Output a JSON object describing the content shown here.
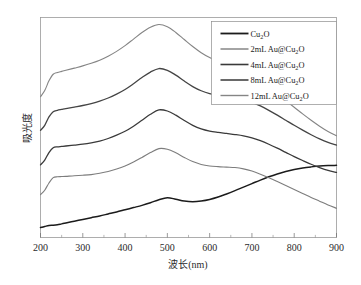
{
  "chart_data": {
    "type": "line",
    "title": "",
    "xlabel": "波长(nm)",
    "ylabel": "吸光度",
    "xlim": [
      200,
      900
    ],
    "ylim": [
      0,
      1
    ],
    "xticks": [
      200,
      300,
      400,
      500,
      600,
      700,
      800,
      900
    ],
    "xticklabels": [
      "200",
      "300",
      "400",
      "500",
      "600",
      "700",
      "800",
      "900"
    ],
    "yticks": [],
    "yticklabels": [],
    "grid": false,
    "legend_position": "upper right",
    "note": "UV-Vis absorption spectra; curves vertically offset; y-axis unlabeled (arbitrary absorbance units)",
    "x": [
      200,
      210,
      220,
      230,
      240,
      250,
      260,
      280,
      300,
      320,
      340,
      360,
      380,
      400,
      420,
      440,
      460,
      480,
      500,
      520,
      540,
      560,
      580,
      600,
      620,
      640,
      660,
      680,
      700,
      720,
      740,
      760,
      780,
      800,
      820,
      840,
      860,
      880,
      900
    ],
    "series": [
      {
        "name": "Cu2O",
        "color": "#1b1b1b",
        "width": 1.5,
        "values": [
          0.045,
          0.05,
          0.055,
          0.056,
          0.058,
          0.062,
          0.066,
          0.074,
          0.082,
          0.09,
          0.098,
          0.107,
          0.116,
          0.126,
          0.136,
          0.146,
          0.158,
          0.172,
          0.181,
          0.174,
          0.166,
          0.163,
          0.166,
          0.173,
          0.184,
          0.198,
          0.213,
          0.229,
          0.245,
          0.261,
          0.276,
          0.289,
          0.3,
          0.309,
          0.316,
          0.321,
          0.325,
          0.327,
          0.328
        ]
      },
      {
        "name": "2mL Au@Cu2O",
        "color": "#7d7d7d",
        "width": 1.1,
        "values": [
          0.195,
          0.215,
          0.248,
          0.272,
          0.276,
          0.277,
          0.278,
          0.281,
          0.283,
          0.286,
          0.292,
          0.3,
          0.311,
          0.325,
          0.343,
          0.364,
          0.386,
          0.404,
          0.401,
          0.385,
          0.364,
          0.345,
          0.332,
          0.325,
          0.322,
          0.32,
          0.318,
          0.312,
          0.302,
          0.288,
          0.272,
          0.254,
          0.236,
          0.218,
          0.2,
          0.182,
          0.165,
          0.148,
          0.133
        ]
      },
      {
        "name": "4mL Au@Cu2O",
        "color": "#3a3a3a",
        "width": 1.3,
        "values": [
          0.33,
          0.352,
          0.386,
          0.408,
          0.412,
          0.414,
          0.416,
          0.42,
          0.424,
          0.43,
          0.438,
          0.45,
          0.465,
          0.483,
          0.506,
          0.533,
          0.56,
          0.58,
          0.575,
          0.556,
          0.532,
          0.51,
          0.494,
          0.484,
          0.478,
          0.473,
          0.468,
          0.462,
          0.453,
          0.44,
          0.424,
          0.406,
          0.387,
          0.368,
          0.35,
          0.333,
          0.318,
          0.305,
          0.296
        ]
      },
      {
        "name": "8mL Au@Cu2O",
        "color": "#444444",
        "width": 1.3,
        "values": [
          0.487,
          0.51,
          0.548,
          0.572,
          0.578,
          0.582,
          0.586,
          0.593,
          0.6,
          0.609,
          0.62,
          0.634,
          0.652,
          0.673,
          0.699,
          0.727,
          0.752,
          0.768,
          0.76,
          0.738,
          0.711,
          0.686,
          0.667,
          0.654,
          0.646,
          0.64,
          0.634,
          0.626,
          0.614,
          0.598,
          0.578,
          0.556,
          0.533,
          0.51,
          0.488,
          0.467,
          0.448,
          0.432,
          0.42
        ]
      },
      {
        "name": "12mL Au@Cu2O",
        "color": "#858585",
        "width": 1.1,
        "values": [
          0.64,
          0.668,
          0.712,
          0.742,
          0.75,
          0.755,
          0.76,
          0.77,
          0.78,
          0.792,
          0.806,
          0.824,
          0.846,
          0.872,
          0.902,
          0.932,
          0.956,
          0.968,
          0.958,
          0.932,
          0.9,
          0.868,
          0.84,
          0.818,
          0.8,
          0.784,
          0.768,
          0.75,
          0.73,
          0.706,
          0.68,
          0.652,
          0.622,
          0.592,
          0.562,
          0.533,
          0.506,
          0.482,
          0.462
        ]
      }
    ],
    "legend_entries": [
      {
        "label_parts": [
          "Cu",
          "2",
          "O"
        ],
        "plain": "Cu2O"
      },
      {
        "label_parts": [
          "2mL Au@Cu",
          "2",
          "O"
        ],
        "plain": "2mL Au@Cu2O"
      },
      {
        "label_parts": [
          "4mL Au@Cu",
          "2",
          "O"
        ],
        "plain": "4mL Au@Cu2O"
      },
      {
        "label_parts": [
          "8mL Au@Cu",
          "2",
          "O"
        ],
        "plain": "8mL Au@Cu2O"
      },
      {
        "label_parts": [
          "12mL Au@Cu",
          "2",
          "O"
        ],
        "plain": "12mL Au@Cu2O"
      }
    ]
  },
  "axes": {
    "x_title": "波长(nm)",
    "y_title": "吸光度",
    "x_tick_labels": [
      "200",
      "300",
      "400",
      "500",
      "600",
      "700",
      "800",
      "900"
    ]
  },
  "legend": {
    "items": [
      {
        "pre": "Cu",
        "sub": "2",
        "post": "O"
      },
      {
        "pre": "2mL Au@Cu",
        "sub": "2",
        "post": "O"
      },
      {
        "pre": "4mL Au@Cu",
        "sub": "2",
        "post": "O"
      },
      {
        "pre": "8mL Au@Cu",
        "sub": "2",
        "post": "O"
      },
      {
        "pre": "12mL Au@Cu",
        "sub": "2",
        "post": "O"
      }
    ]
  },
  "colors": {
    "frame": "#9a9a9a",
    "background": "#ffffff",
    "text": "#1a1a1a"
  }
}
